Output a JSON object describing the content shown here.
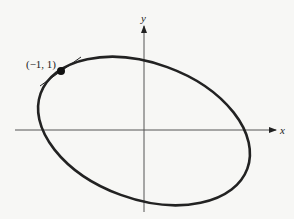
{
  "figure": {
    "axes": {
      "x_label": "x",
      "y_label": "y",
      "origin": [
        144,
        130
      ],
      "x_axis": {
        "from": 15,
        "to": 276,
        "y": 130
      },
      "y_axis": {
        "from": 212,
        "to": 25,
        "x": 144
      }
    },
    "curve": {
      "type": "rotated-ellipse",
      "center": [
        144,
        131
      ],
      "rx": 110,
      "ry": 68,
      "rotation_deg": 20,
      "stroke": "#222222"
    },
    "point": {
      "label": "(−1, 1)",
      "position": [
        61,
        71
      ]
    },
    "tangent_line": {
      "from": [
        40,
        86
      ],
      "to": [
        81,
        57
      ]
    },
    "colors": {
      "background": "#f7f7f5",
      "ink": "#222222",
      "axis": "#555555"
    }
  }
}
